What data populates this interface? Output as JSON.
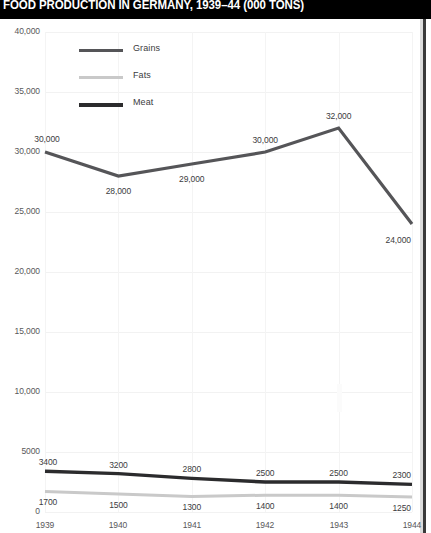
{
  "title": "FOOD PRODUCTION IN GERMANY, 1939–44 (000 TONS)",
  "colors": {
    "title_bar": "#000000",
    "title_text": "#ffffff",
    "grains": "#555558",
    "fats": "#c9c9c9",
    "meat": "#2b2b2d",
    "gridline": "#f2f2f2",
    "axis_text": "#58585a",
    "label_text": "#3c3c3e"
  },
  "legend": {
    "items": [
      {
        "label": "Grains",
        "color": "#555558"
      },
      {
        "label": "Fats",
        "color": "#c9c9c9"
      },
      {
        "label": "Meat",
        "color": "#2b2b2d"
      }
    ]
  },
  "axes": {
    "y_ticks": [
      "40,000",
      "35,000",
      "30,000",
      "25,000",
      "20,000",
      "15,000",
      "10,000",
      "5000",
      "0"
    ],
    "x_ticks": [
      "1939",
      "1940",
      "1941",
      "1942",
      "1943",
      "1944"
    ]
  },
  "chart_data": {
    "type": "line",
    "title": "FOOD PRODUCTION IN GERMANY, 1939–44 (000 TONS)",
    "xlabel": "",
    "ylabel": "",
    "ylim": [
      0,
      40000
    ],
    "yticks": [
      0,
      5000,
      10000,
      15000,
      20000,
      25000,
      30000,
      35000,
      40000
    ],
    "ytick_labels": [
      "0",
      "5000",
      "10,000",
      "15,000",
      "20,000",
      "25,000",
      "30,000",
      "35,000",
      "40,000"
    ],
    "grid": true,
    "legend_position": "top-left",
    "categories": [
      "1939",
      "1940",
      "1941",
      "1942",
      "1943",
      "1944"
    ],
    "series": [
      {
        "name": "Grains",
        "color": "#555558",
        "values": [
          30000,
          28000,
          29000,
          30000,
          32000,
          24000
        ],
        "labels": [
          "30,000",
          "28,000",
          "29,000",
          "30,000",
          "32,000",
          "24,000"
        ]
      },
      {
        "name": "Fats",
        "color": "#c9c9c9",
        "values": [
          1700,
          1500,
          1300,
          1400,
          1400,
          1250
        ],
        "labels": [
          "1700",
          "1500",
          "1300",
          "1400",
          "1400",
          "1250"
        ]
      },
      {
        "name": "Meat",
        "color": "#2b2b2d",
        "values": [
          3400,
          3200,
          2800,
          2500,
          2500,
          2300
        ],
        "labels": [
          "3400",
          "3200",
          "2800",
          "2500",
          "2500",
          "2300"
        ]
      }
    ]
  }
}
